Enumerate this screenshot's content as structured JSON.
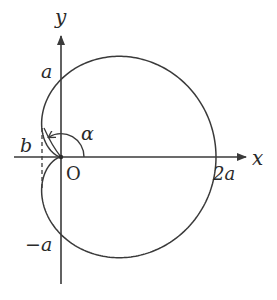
{
  "diagram": {
    "type": "cardioid",
    "equation_form": "r = a(1 + cos θ)",
    "colors": {
      "stroke": "#3a3a3a",
      "background": "#ffffff"
    },
    "axes": {
      "x_label": "x",
      "y_label": "y",
      "origin_label": "O"
    },
    "labels": {
      "a": "a",
      "neg_a": "−a",
      "two_a": "2a",
      "b": "b",
      "alpha": "α"
    }
  }
}
